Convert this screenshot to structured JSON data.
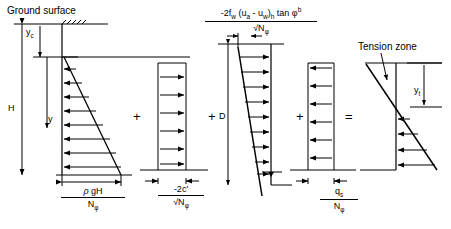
{
  "figure": {
    "title_labels": {
      "ground_surface": "Ground surface",
      "tension_zone": "Tension zone"
    },
    "dimensions": {
      "depth_total": "H",
      "depth_tension_crack": "y",
      "depth_crack_sub": "c",
      "depth_variable": "y",
      "depth_water": "D",
      "depth_tension_zone": "y",
      "depth_tension_zone_sub": "t"
    },
    "operators": {
      "plus_1": "+",
      "plus_2": "+",
      "plus_3": "+",
      "equals": "="
    },
    "pressure_terms": [
      {
        "id": "self-weight",
        "numerator": "ρ gH",
        "denominator": "Nφ",
        "position": "bottom",
        "shape": "triangle-decreasing"
      },
      {
        "id": "cohesion",
        "numerator": "-2c'",
        "denominator": "√Nφ",
        "position": "bottom",
        "shape": "uniform-rectangle"
      },
      {
        "id": "matric-suction",
        "numerator": "-2fᵥᵥ (uₐ - uᵥᵥ)ₕ tan φᵇ",
        "denominator": "√Nφ",
        "position": "top",
        "shape": "triangle-increasing"
      },
      {
        "id": "surcharge",
        "numerator": "qₛ",
        "denominator": "Nφ",
        "position": "bottom",
        "shape": "uniform-rectangle"
      }
    ],
    "formula_top": {
      "num_prefix": "-2f",
      "num_sub1": "w",
      "num_mid": " (u",
      "num_sub2": "a",
      "num_mid2": " - u",
      "num_sub3": "w",
      "num_mid3": ")",
      "num_sub4": "h",
      "num_tail": " tan ",
      "num_phi": "φ",
      "num_sup": "b",
      "den_radical": "√N",
      "den_sub": "φ"
    },
    "frac_rho": {
      "num_rho": "ρ",
      "num_rest": " gH",
      "den_N": "N",
      "den_sub": "φ"
    },
    "frac_c": {
      "num": "-2c'",
      "den_radical": "√N",
      "den_sub": "φ"
    },
    "frac_q": {
      "num_q": "q",
      "num_sub": "s",
      "den_N": "N",
      "den_sub": "φ"
    },
    "colors": {
      "line": "#000000",
      "background": "#ffffff"
    }
  }
}
